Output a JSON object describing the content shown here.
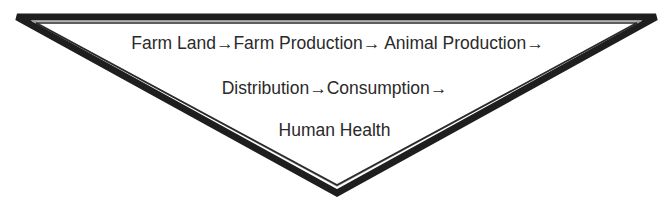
{
  "diagram": {
    "shape": "inverted-triangle",
    "border_color": "#1e1e1e",
    "lines": [
      "Farm Land→Farm Production→ Animal Production→",
      "Distribution→Consumption→",
      "Human Health"
    ]
  }
}
